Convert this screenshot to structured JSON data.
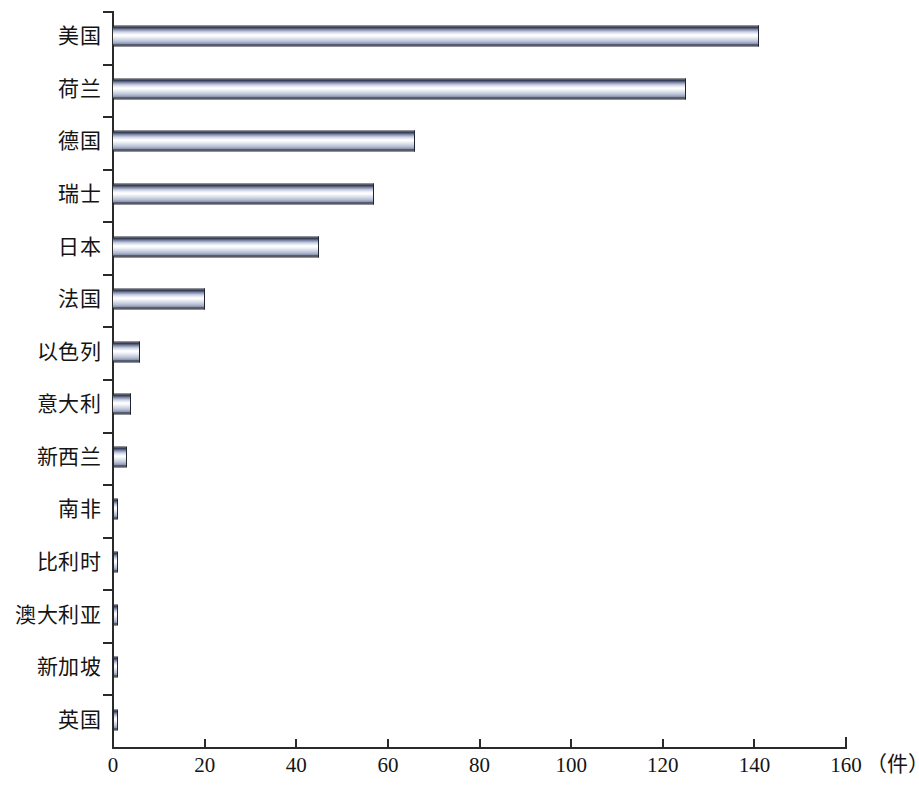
{
  "chart_data": {
    "type": "bar",
    "orientation": "horizontal",
    "title": "",
    "subtitle": "",
    "xlabel": "（件）",
    "ylabel": "",
    "xlim": [
      0,
      160
    ],
    "xticks": [
      0,
      20,
      40,
      60,
      80,
      100,
      120,
      140,
      160
    ],
    "xtick_labels": [
      "0",
      "20",
      "40",
      "60",
      "80",
      "100",
      "120",
      "140",
      "160"
    ],
    "grid": false,
    "legend": null,
    "unit_label": "（件）",
    "categories": [
      "美国",
      "荷兰",
      "德国",
      "瑞士",
      "日本",
      "法国",
      "以色列",
      "意大利",
      "新西兰",
      "南非",
      "比利时",
      "澳大利亚",
      "新加坡",
      "英国"
    ],
    "values": [
      141,
      125,
      66,
      57,
      45,
      20,
      6,
      4,
      3,
      1,
      1,
      1,
      1,
      1
    ],
    "series": [
      {
        "name": "",
        "values": [
          141,
          125,
          66,
          57,
          45,
          20,
          6,
          4,
          3,
          1,
          1,
          1,
          1,
          1
        ]
      }
    ],
    "bar_color": "#c9cfe0",
    "bar_edge_color": "#20242e",
    "axis_color": "#2a2a2a",
    "background_color": "#ffffff"
  },
  "axis": {
    "x_unit": "（件）",
    "x_tick_labels": [
      "0",
      "20",
      "40",
      "60",
      "80",
      "100",
      "120",
      "140",
      "160"
    ]
  }
}
